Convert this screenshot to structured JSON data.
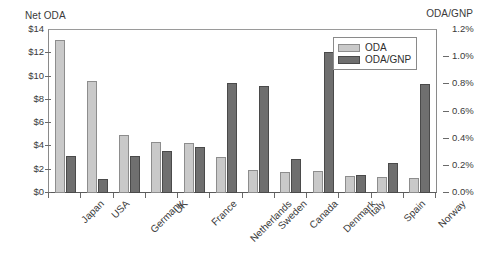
{
  "chart_data": {
    "type": "bar",
    "title": "",
    "subtitle": "",
    "xlabel": "",
    "ylabel": "Net ODA",
    "y2label": "ODA/GNP",
    "grid": false,
    "legend_position": "top-right",
    "categories": [
      "Japan",
      "USA",
      "Germany",
      "UK",
      "France",
      "Netherlands",
      "Sweden",
      "Canada",
      "Denmark",
      "Italy",
      "Spain",
      "Norway"
    ],
    "series": [
      {
        "name": "ODA",
        "axis": "left",
        "unit": "US$ billions",
        "color": "#c9c9c9",
        "values": [
          13.1,
          9.6,
          5.0,
          4.4,
          4.3,
          3.1,
          2.0,
          1.8,
          1.9,
          1.5,
          1.4,
          1.3
        ]
      },
      {
        "name": "ODA/GNP",
        "axis": "right",
        "unit": "percent",
        "color": "#6f6f6f",
        "values": [
          0.27,
          0.1,
          0.27,
          0.31,
          0.34,
          0.81,
          0.79,
          0.25,
          1.04,
          0.13,
          0.22,
          0.8
        ]
      }
    ],
    "ylim": [
      0,
      14
    ],
    "y2lim": [
      0.0,
      1.2
    ],
    "yticks": [
      0,
      2,
      4,
      6,
      8,
      10,
      12,
      14
    ],
    "ytick_labels": [
      "$0",
      "$2",
      "$4",
      "$6",
      "$8",
      "$10",
      "$12",
      "$14"
    ],
    "y2ticks": [
      0.0,
      0.2,
      0.4,
      0.6,
      0.8,
      1.0,
      1.2
    ],
    "y2tick_labels": [
      "0.0%",
      "0.2%",
      "0.4%",
      "0.6%",
      "0.8%",
      "1.0%",
      "1.2%"
    ]
  },
  "axes": {
    "left_title": "Net ODA",
    "right_title": "ODA/GNP"
  },
  "legend": {
    "items": [
      {
        "label": "ODA",
        "color": "#c9c9c9"
      },
      {
        "label": "ODA/GNP",
        "color": "#6f6f6f"
      }
    ]
  },
  "colors": {
    "oda": "#c9c9c9",
    "odagnp": "#6f6f6f",
    "axis": "#6a6a6a",
    "text": "#3a3a3a",
    "background": "#ffffff"
  }
}
